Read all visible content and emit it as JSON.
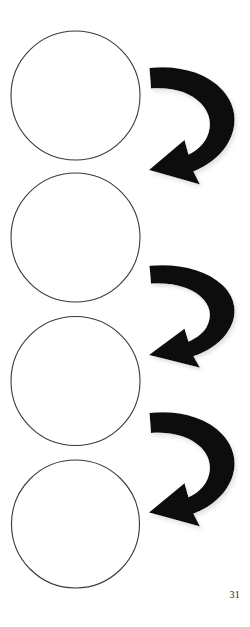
{
  "page": {
    "number": "31",
    "width": 250,
    "height": 627,
    "background_color": "#ffffff"
  },
  "figure": {
    "type": "cycle-diagram",
    "stroke_color": "#3a3a3a",
    "arrow_color": "#111111",
    "shadow_color": "#c9c9c9",
    "circles": [
      {
        "id": "circle-1",
        "label": "",
        "cx": 75.5,
        "cy": 95.5,
        "r": 64.5
      },
      {
        "id": "circle-2",
        "label": "",
        "cx": 75.5,
        "cy": 237.5,
        "r": 64.5
      },
      {
        "id": "circle-3",
        "label": "",
        "cx": 75.5,
        "cy": 381.0,
        "r": 64.5
      },
      {
        "id": "circle-4",
        "label": "",
        "cx": 75.5,
        "cy": 524.0,
        "r": 64.0
      }
    ],
    "arrows": [
      {
        "id": "arrow-1",
        "from": "circle-1",
        "to": "circle-2",
        "direction": "clockwise",
        "x": 148,
        "y": 66,
        "width": 90,
        "height": 120
      },
      {
        "id": "arrow-2",
        "from": "circle-2",
        "to": "circle-3",
        "direction": "clockwise",
        "x": 148,
        "y": 264,
        "width": 90,
        "height": 105
      },
      {
        "id": "arrow-3",
        "from": "circle-3",
        "to": "circle-4",
        "direction": "clockwise",
        "x": 148,
        "y": 411,
        "width": 90,
        "height": 117
      }
    ]
  }
}
